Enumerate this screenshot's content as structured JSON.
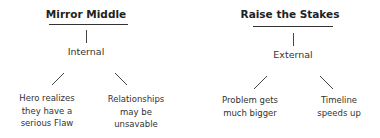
{
  "trees": [
    {
      "title": "Mirror Middle",
      "category": "Internal",
      "leaves": [
        {
          "text": "Hero realizes they have a serious Flaw",
          "lines": [
            "Hero realizes",
            "they have a",
            "serious Flaw"
          ]
        },
        {
          "text": "Relationships may be unsavable",
          "lines": [
            "Relationships",
            "may be",
            "unsavable"
          ]
        }
      ]
    },
    {
      "title": "Raise the Stakes",
      "category": "External",
      "leaves": [
        {
          "text": "Problem gets much bigger",
          "lines": [
            "Problem gets",
            "much bigger"
          ]
        },
        {
          "text": "Timeline speeds up",
          "lines": [
            "Timeline",
            "speeds up"
          ]
        }
      ]
    }
  ],
  "colors": {
    "text": "#333333",
    "title": "#222222",
    "line": "#444444",
    "background": "#ffffff"
  }
}
